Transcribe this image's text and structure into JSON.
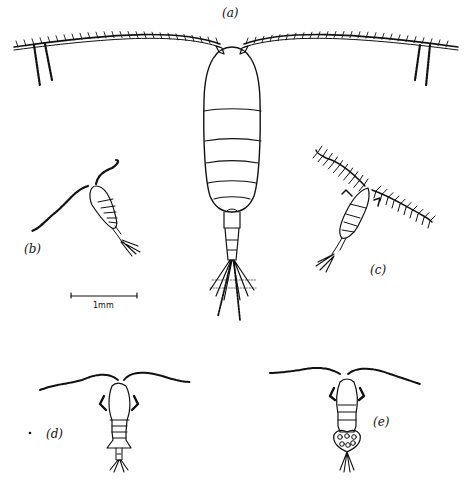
{
  "figure": {
    "type": "scientific line illustration",
    "ink_color": "#111111",
    "background_color": "#ffffff"
  },
  "panels": [
    {
      "id": "a",
      "label": "(a)"
    },
    {
      "id": "b",
      "label": "(b)"
    },
    {
      "id": "c",
      "label": "(c)"
    },
    {
      "id": "d",
      "label": "(d)"
    },
    {
      "id": "e",
      "label": "(e)"
    }
  ],
  "scale_bar": {
    "label": "1mm"
  },
  "stray_mark": "."
}
